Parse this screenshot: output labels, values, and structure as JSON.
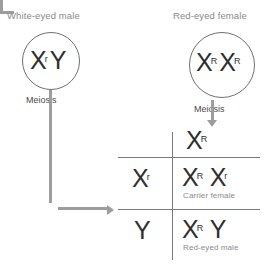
{
  "diagram": {
    "title_male": "White-eyed male",
    "title_female": "Red-eyed female",
    "meiosis_label_male": "Meiosis",
    "meiosis_label_female": "Meiosis",
    "parents": {
      "male": {
        "allele1": "X",
        "allele1_sup": "r",
        "allele2": "Y",
        "allele2_sup": ""
      },
      "female": {
        "allele1": "X",
        "allele1_sup": "R",
        "allele2": "X",
        "allele2_sup": "R"
      }
    },
    "gametes": {
      "top": {
        "symbol": "X",
        "sup": "R"
      },
      "side": [
        {
          "symbol": "X",
          "sup": "r"
        },
        {
          "symbol": "Y",
          "sup": ""
        }
      ]
    },
    "offspring": [
      {
        "a1": "X",
        "a1_sup": "R",
        "a2": "X",
        "a2_sup": "r",
        "phenotype": "Carrier female"
      },
      {
        "a1": "X",
        "a1_sup": "R",
        "a2": "Y",
        "a2_sup": "",
        "phenotype": "Red-eyed male"
      }
    ],
    "colors": {
      "text_dark": "#2f2f2f",
      "text_muted": "#8a8a8a",
      "line": "#7a7a7a",
      "arrow": "#9d9d9d"
    }
  }
}
